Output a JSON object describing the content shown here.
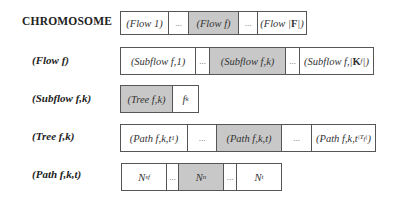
{
  "labels": {
    "chromosome": "CHROMOSOME",
    "flow": "(Flow f)",
    "subflow": "(Subflow f,k)",
    "tree": "(Tree f,k)",
    "path": "(Path f,k,t)"
  },
  "rows": {
    "chromosome": {
      "cells": [
        "(Flow 1)",
        "...",
        "(Flow f)",
        "...",
        "(Flow |F|)"
      ],
      "shaded_index": 2
    },
    "flow": {
      "cells": [
        "(Subflow f,1)",
        "...",
        "(Subflow f,k)",
        "...",
        "(Subflow f,|K_f|)"
      ],
      "shaded_index": 2
    },
    "subflow": {
      "cells": [
        "(Tree f,k)",
        "f_k"
      ],
      "shaded_index": 0
    },
    "tree": {
      "cells": [
        "(Path f,k,t_1)",
        "...",
        "(Path f,k,t)",
        "...",
        "(Path f,k,t_|T_f|)"
      ],
      "shaded_index": 2
    },
    "path": {
      "cells": [
        "N_sf",
        "...",
        "N_n",
        "...",
        "N_t"
      ],
      "shaded_index": 2
    }
  },
  "colors": {
    "shaded": "#c8c8c8",
    "border": "#555555",
    "background": "#ffffff"
  }
}
